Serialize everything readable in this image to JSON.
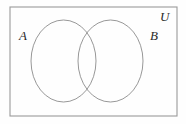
{
  "figure": {
    "kind": "venn-diagram",
    "width": 186,
    "height": 124,
    "background_color": "#fefefe",
    "line_color": "#8c8c8c",
    "label_color": "#2a2a2a"
  },
  "universe": {
    "label": "U",
    "shape": "rectangle",
    "x": 10,
    "y": 7,
    "width": 167,
    "height": 109,
    "stroke": "#9a9a9a",
    "stroke_width": 1.1,
    "fill": "none"
  },
  "sets": [
    {
      "label": "A",
      "shape": "ellipse",
      "cx": 63.5,
      "cy": 61,
      "rx": 32.5,
      "ry": 41,
      "stroke": "#8c8c8c",
      "stroke_width": 0.9,
      "fill": "none"
    },
    {
      "label": "B",
      "shape": "ellipse",
      "cx": 110.5,
      "cy": 61,
      "rx": 32.5,
      "ry": 41,
      "stroke": "#8c8c8c",
      "stroke_width": 0.9,
      "fill": "none"
    }
  ],
  "labels": {
    "set_a": "A",
    "set_b": "B",
    "universe": "U"
  },
  "regions": {
    "intersection_x_range": [
      78,
      96
    ],
    "shaded": false,
    "shading_description": "no region is shaded; all regions unfilled"
  }
}
